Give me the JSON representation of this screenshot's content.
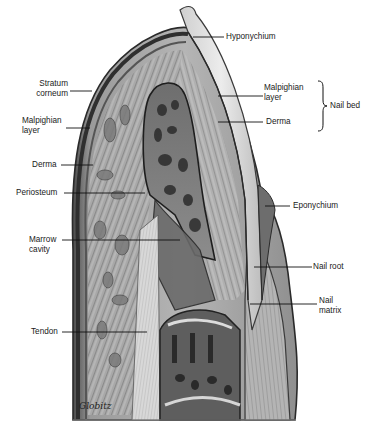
{
  "figure": {
    "signature": "Globitz"
  },
  "labels": {
    "hyponychium": "Hyponychium",
    "stratum_corneum_1": "Stratum",
    "stratum_corneum_2": "corneum",
    "malpighian_left_1": "Malpighian",
    "malpighian_left_2": "layer",
    "derma_left": "Derma",
    "periosteum": "Periosteum",
    "marrow_1": "Marrow",
    "marrow_2": "cavity",
    "tendon": "Tendon",
    "malpighian_right_1": "Malpighian",
    "malpighian_right_2": "layer",
    "derma_right": "Derma",
    "nail_bed": "Nail bed",
    "eponychium": "Eponychium",
    "nail_root": "Nail root",
    "nail_matrix_1": "Nail",
    "nail_matrix_2": "matrix"
  },
  "colors": {
    "background": "#ffffff",
    "tissue_dark": "#3a3a3a",
    "tissue_mid": "#8a8a8a",
    "tissue_light": "#c8c8c8",
    "nail": "#e6e6e6",
    "leader": "#111111"
  }
}
